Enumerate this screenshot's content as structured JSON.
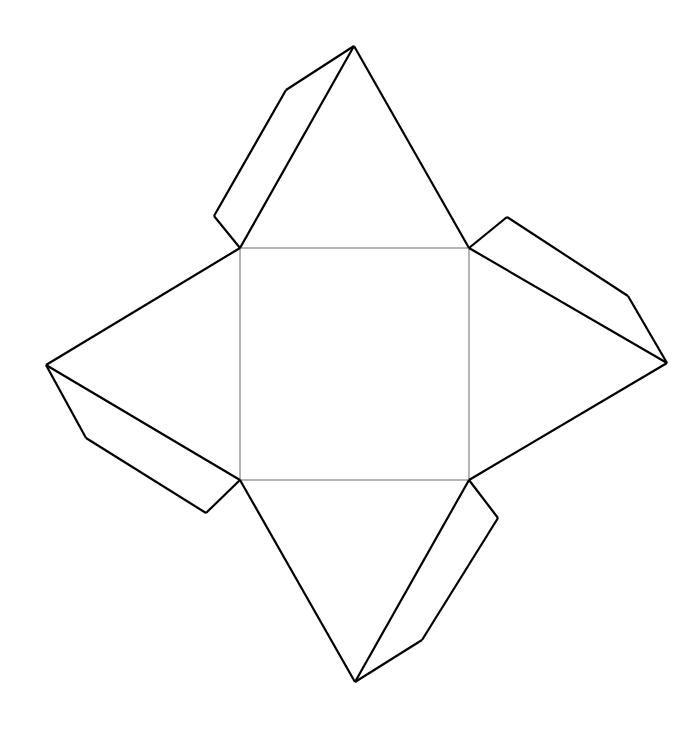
{
  "document": {
    "title": "Square pyramid net with glue tabs",
    "background_color": "#ffffff",
    "width": 696,
    "height": 730
  },
  "styles": {
    "cut_line_color": "#000000",
    "cut_line_width": 2.2,
    "fold_line_color": "#6b6b6b",
    "fold_line_width": 1,
    "face_fill": "#ffffff"
  },
  "geometry": {
    "base_square": {
      "name": "base-square",
      "points": "240,248 469,248 469,480 240,480",
      "corners": {
        "top_left": [
          240,
          248
        ],
        "top_right": [
          469,
          248
        ],
        "bottom_right": [
          469,
          480
        ],
        "bottom_left": [
          240,
          480
        ]
      }
    },
    "triangles": [
      {
        "name": "top-triangle",
        "apex": [
          354,
          46
        ],
        "points": "240,248 354,46 469,248"
      },
      {
        "name": "right-triangle",
        "apex": [
          667,
          363
        ],
        "points": "469,248 667,363 469,480"
      },
      {
        "name": "bottom-triangle",
        "apex": [
          355,
          682
        ],
        "points": "240,480 355,682 469,480"
      },
      {
        "name": "left-triangle",
        "apex": [
          46,
          365
        ],
        "points": "240,248 46,365 240,480"
      }
    ],
    "tabs": [
      {
        "name": "top-left-tab",
        "points": "354,46 286,90 214,216 240,248",
        "fold_edge": "240,248 354,46"
      },
      {
        "name": "left-bottom-tab",
        "points": "46,365 86,438 206,513 240,480",
        "fold_edge": "240,480 46,365"
      },
      {
        "name": "right-top-tab",
        "points": "469,248 507,217 628,296 667,363",
        "fold_edge": "469,248 667,363"
      },
      {
        "name": "bottom-right-tab",
        "points": "469,480 498,518 422,640 355,682",
        "fold_edge": "469,480 355,682"
      }
    ],
    "outline": "354,46 286,90 214,216 46,365 86,438 206,513 355,682 422,640 498,518 667,363 628,296 507,217 354,46",
    "fold_lines": [
      "240,248 469,248",
      "469,248 469,480",
      "469,480 240,480",
      "240,480 240,248"
    ],
    "cut_lines": [
      "354,46 240,248",
      "354,46 469,248",
      "469,248 667,363",
      "667,363 469,480",
      "469,480 355,682",
      "355,682 240,480",
      "240,480 46,365",
      "46,365 240,248",
      "354,46 286,90",
      "286,90 214,216",
      "214,216 240,248",
      "46,365 86,438",
      "86,438 206,513",
      "206,513 240,480",
      "469,248 507,217",
      "507,217 628,296",
      "628,296 667,363",
      "469,480 498,518",
      "498,518 422,640",
      "422,640 355,682"
    ]
  }
}
